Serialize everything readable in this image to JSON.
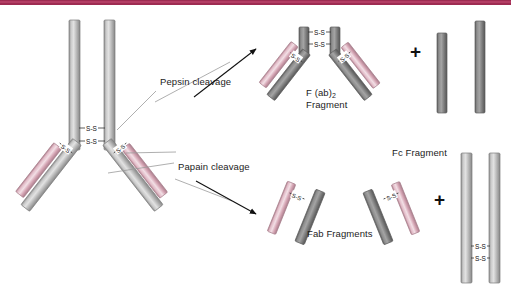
{
  "figure": {
    "title_bar_color": "#9e2b52",
    "background_color": "#ffffff",
    "heavy_chain_color": "#a8a8a8",
    "light_chain_color": "#d8a9b8",
    "fc_chain_color": "#6e6e6e",
    "bond_label": "S-S",
    "plus_symbol": "+"
  },
  "labels": {
    "pepsin_cleavage": "Pepsin cleavage",
    "papain_cleavage": "Papain cleavage",
    "fab2_fragment_line1": "F (ab)",
    "fab2_fragment_sub": "2",
    "fab2_fragment_line2": "Fragment",
    "fc_fragment": "Fc Fragment",
    "fab_fragments": "Fab Fragments",
    "plus_top": "+",
    "plus_bottom": "+"
  },
  "bonds": {
    "intact_antibody_hinge": [
      "S-S",
      "S-S"
    ],
    "intact_antibody_left_arm": "S-S",
    "intact_antibody_right_arm": "S-S",
    "fab2_hinge": [
      "S-S",
      "S-S"
    ],
    "fab2_left_arm": "S-S",
    "fab2_right_arm": "S-S",
    "fc_fragment_bottom": [
      "S-S",
      "S-S"
    ],
    "fab_left": "S-S",
    "fab_right": "S-S"
  },
  "structures": {
    "intact_antibody": "IgG Y-shaped antibody with two heavy chains and two light chains",
    "pepsin_products": [
      "F (ab)2 Fragment",
      "Fc peptide fragments"
    ],
    "papain_products": [
      "Fab Fragments",
      "Fc Fragment"
    ]
  }
}
